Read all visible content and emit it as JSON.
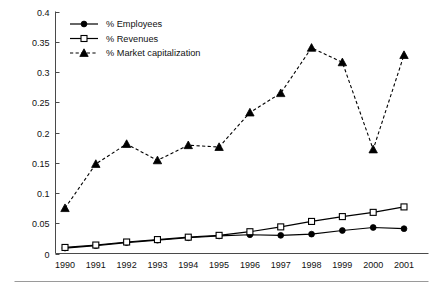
{
  "chart_data": {
    "type": "line",
    "title": "",
    "subtitle": "",
    "xlabel": "",
    "ylabel": "",
    "categories": [
      "1990",
      "1991",
      "1992",
      "1993",
      "1994",
      "1995",
      "1996",
      "1997",
      "1998",
      "1999",
      "2000",
      "2001"
    ],
    "x": [
      1990,
      1991,
      1992,
      1993,
      1994,
      1995,
      1996,
      1997,
      1998,
      1999,
      2000,
      2001
    ],
    "xlim": [
      1990,
      2001
    ],
    "ylim": [
      0,
      0.4
    ],
    "yticks": [
      0,
      0.05,
      0.1,
      0.15,
      0.2,
      0.25,
      0.3,
      0.35,
      0.4
    ],
    "ytick_labels": [
      "0",
      "0.05",
      "0.1",
      "0.15",
      "0.2",
      "0.25",
      "0.3",
      "0.35",
      "0.4"
    ],
    "grid": false,
    "legend_position": "top-left",
    "series": [
      {
        "name": "% Employees",
        "marker": "filled-circle",
        "linestyle": "solid",
        "color": "#000000",
        "values": [
          0.009,
          0.013,
          0.018,
          0.022,
          0.026,
          0.029,
          0.031,
          0.03,
          0.032,
          0.038,
          0.043,
          0.041
        ]
      },
      {
        "name": "% Revenues",
        "marker": "open-square",
        "linestyle": "solid",
        "color": "#000000",
        "values": [
          0.01,
          0.014,
          0.019,
          0.023,
          0.027,
          0.03,
          0.036,
          0.044,
          0.053,
          0.061,
          0.068,
          0.077
        ]
      },
      {
        "name": "% Market capitalization",
        "marker": "filled-triangle",
        "linestyle": "dashed",
        "color": "#000000",
        "values": [
          0.075,
          0.148,
          0.181,
          0.154,
          0.179,
          0.176,
          0.233,
          0.265,
          0.34,
          0.316,
          0.172,
          0.328
        ]
      }
    ]
  },
  "legend": {
    "items": [
      {
        "label": "% Employees"
      },
      {
        "label": "% Revenues"
      },
      {
        "label": "% Market capitalization"
      }
    ]
  },
  "axes": {
    "y_tick_labels": [
      "0.4",
      "0.35",
      "0.3",
      "0.25",
      "0.2",
      "0.15",
      "0.1",
      "0.05",
      "0"
    ],
    "x_tick_labels": [
      "1990",
      "1991",
      "1992",
      "1993",
      "1994",
      "1995",
      "1996",
      "1997",
      "1998",
      "1999",
      "2000",
      "2001"
    ]
  },
  "colors": {
    "axis": "#4a4a4a",
    "series": "#000000",
    "rule": "#9a9a9a",
    "background": "#ffffff"
  }
}
